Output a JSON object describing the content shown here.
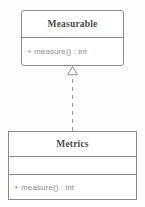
{
  "diagram": {
    "type": "uml-class-diagram",
    "background_color": "#fdfdfd",
    "line_color": "#8a8a8a",
    "name_text_color": "#4a4a4a",
    "member_text_color": "#8d8d8d",
    "classes": [
      {
        "id": "measurable",
        "name": "Measurable",
        "stereotype": "",
        "attributes": [],
        "operations": [
          {
            "visibility": "+",
            "signature": "+ measure() : int"
          }
        ],
        "has_attributes_compartment": false
      },
      {
        "id": "metrics",
        "name": "Metrics",
        "stereotype": "",
        "attributes": [
          {
            "text": ""
          }
        ],
        "operations": [
          {
            "visibility": "+",
            "signature": "+ measure() : int"
          }
        ],
        "has_attributes_compartment": true
      }
    ],
    "relationships": [
      {
        "id": "metrics-implements-measurable",
        "type": "realization",
        "label": "",
        "source": "Metrics",
        "target": "Measurable",
        "line_style": "dashed",
        "arrowhead": "hollow-triangle",
        "arrowhead_icon": "hollow-triangle-icon"
      }
    ]
  }
}
